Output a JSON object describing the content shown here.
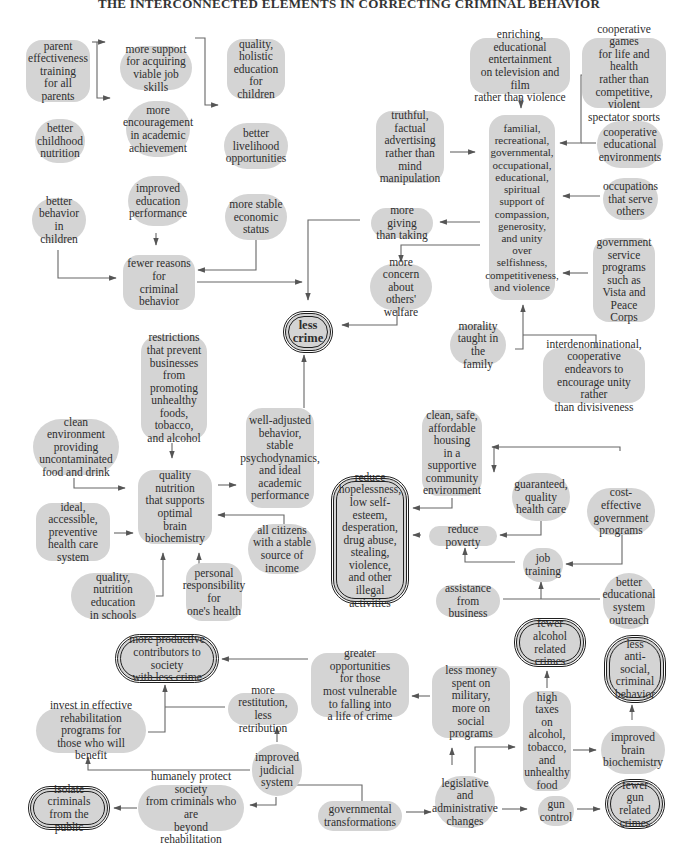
{
  "title": "THE INTERCONNECTED ELEMENTS IN CORRECTING CRIMINAL BEHAVIOR",
  "colors": {
    "node_fill": "#d4d4d4",
    "line": "#555555",
    "outcome_border": "#1f1f1f"
  },
  "nodes": {
    "parent_training": "parent\neffectiveness\ntraining\nfor all parents",
    "job_skills": "more support\nfor acquiring\nviable job skills",
    "holistic_education": "quality,\nholistic\neducation\nfor children",
    "childhood_nutrition": "better\nchildhood\nnutrition",
    "academic_encouragement": "more\nencouragement\nin academic\nachievement",
    "livelihood": "better\nlivelihood\nopportunities",
    "behavior_children": "better\nbehavior\nin children",
    "education_performance": "improved\neducation\nperformance",
    "stable_economic": "more stable\neconomic\nstatus",
    "fewer_reasons": "fewer reasons\nfor\ncriminal\nbehavior",
    "less_crime": "less\ncrime",
    "enriching_entertainment": "enriching, educational\nentertainment\non television and film\nrather than violence",
    "cooperative_games": "cooperative games\nfor life and health\nrather than\ncompetitive, violent\nspectator sports",
    "truthful_advertising": "truthful, factual\nadvertising\nrather than\nmind\nmanipulation",
    "familial_support": "familial,\nrecreational,\ngovernmental,\noccupational,\neducational,\nspiritual\nsupport of\ncompassion,\ngenerosity,\nand unity\nover\nselfishness,\ncompetitiveness,\nand violence",
    "cooperative_environments": "cooperative\neducational\nenvironments",
    "occupations_serve": "occupations\nthat serve\nothers",
    "more_giving": "more giving\nthan taking",
    "more_concern": "more concern\nabout others'\nwelfare",
    "government_service": "government\nservice\nprograms\nsuch as\nVista and\nPeace Corps",
    "morality_family": "morality\ntaught in the\nfamily",
    "interdenominational": "interdenominational,\ncooperative endeavors to\nencourage unity rather\nthan divisiveness",
    "restrictions_businesses": "restrictions\nthat prevent\nbusinesses\nfrom promoting\nunhealthy\nfoods,\ntobacco,\nand alcohol",
    "clean_environment": "clean environment\nproviding\nuncontaminated\nfood and drink",
    "quality_nutrition": "quality nutrition\nthat supports\noptimal\nbrain\nbiochemistry",
    "well_adjusted": "well-adjusted\nbehavior,\nstable\npsychodynamics,\nand ideal\nacademic\nperformance",
    "health_care_system": "ideal, accessible,\npreventive\nhealth care\nsystem",
    "stable_income": "all citizens\nwith a stable\nsource of income",
    "nutrition_education": "quality,\nnutrition education\nin schools",
    "personal_responsibility": "personal\nresponsibility\nfor\none's health",
    "reduce_hopelessness": "reduce\nhopelessness,\nlow self-esteem,\ndesperation,\ndrug abuse,\nstealing,\nviolence,\nand other\nillegal activities",
    "housing": "clean, safe,\naffordable\nhousing\nin a supportive\ncommunity\nenvironment",
    "guaranteed_health": "guaranteed,\nquality\nhealth care",
    "cost_effective": "cost-effective\ngovernment\nprograms",
    "reduce_poverty": "reduce poverty",
    "job_training": "job\ntraining",
    "assistance_business": "assistance from\nbusiness",
    "educational_outreach": "better\neducational\nsystem\noutreach",
    "productive_contributors": "more productive\ncontributors to society\nwith less crime",
    "greater_opportunities": "greater opportunities\nfor those\nmost vulnerable\nto falling into\na life of crime",
    "less_money_military": "less money\nspent on\nmilitary,\nmore on\nsocial programs",
    "fewer_alcohol_crimes": "fewer\nalcohol related\ncrimes",
    "less_antisocial": "less\nanti-social,\ncriminal\nbehavior",
    "restitution": "more restitution,\nless retribution",
    "rehabilitation": "invest in effective\nrehabilitation programs for\nthose who will benefit",
    "judicial_system": "improved\njudicial\nsystem",
    "high_taxes": "high taxes\non\nalcohol,\ntobacco,\nand\nunhealthy\nfood",
    "improved_brain": "improved\nbrain\nbiochemistry",
    "isolate_criminals": "isolate criminals\nfrom the public",
    "protect_society": "humanely protect society\nfrom criminals who are\nbeyond rehabilitation",
    "governmental_transformations": "governmental\ntransformations",
    "legislative_changes": "legislative\nand\nadministrative\nchanges",
    "gun_control": "gun\ncontrol",
    "fewer_gun_crimes": "fewer\ngun related\ncrimes"
  }
}
